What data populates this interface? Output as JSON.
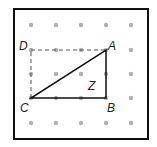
{
  "figure": {
    "frame": {
      "x": 14,
      "y": 9,
      "width": 134,
      "height": 130,
      "stroke": "#111111"
    },
    "grid": {
      "xs": [
        31,
        56,
        81,
        106,
        131
      ],
      "ys": [
        25,
        50,
        74,
        98,
        123
      ],
      "dot_color": "#b0b0b0"
    },
    "points": {
      "A": {
        "x": 106,
        "y": 50
      },
      "B": {
        "x": 106,
        "y": 98
      },
      "C": {
        "x": 31,
        "y": 98
      },
      "D": {
        "x": 31,
        "y": 50
      }
    },
    "labels": {
      "A": "A",
      "B": "B",
      "C": "C",
      "D": "D",
      "Z": "Z"
    },
    "triangle": [
      "A",
      "B",
      "C"
    ],
    "dashed_segments": [
      [
        "C",
        "D"
      ],
      [
        "D",
        "A"
      ]
    ],
    "angle_label": "Z"
  }
}
